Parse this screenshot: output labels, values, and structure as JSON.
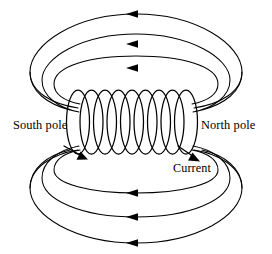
{
  "figure": {
    "type": "physics-diagram"
  },
  "labels": {
    "south_pole": "South pole",
    "north_pole": "North pole",
    "current": "Current"
  },
  "colors": {
    "stroke": "#000000",
    "background": "#ffffff"
  },
  "diagram": {
    "coil": {
      "turns": 9,
      "center_y": 122,
      "x_start": 78,
      "x_end": 186,
      "turn_rx": 11.5,
      "turn_ry": 32
    },
    "field_loops_top": [
      {
        "cx": 136,
        "cy": 52,
        "rx": 102,
        "ry": 44,
        "arrow_y": 14
      },
      {
        "cx": 136,
        "cy": 63,
        "rx": 88,
        "ry": 35,
        "arrow_y": 44
      },
      {
        "cx": 136,
        "cy": 75,
        "rx": 74,
        "ry": 26,
        "arrow_y": 68
      }
    ],
    "field_loops_bottom": [
      {
        "cx": 136,
        "cy": 196,
        "rx": 74,
        "ry": 26,
        "arrow_y": 193
      },
      {
        "cx": 136,
        "cy": 188,
        "rx": 88,
        "ry": 35,
        "arrow_y": 217
      },
      {
        "cx": 136,
        "cy": 200,
        "rx": 102,
        "ry": 44,
        "arrow_y": 243
      }
    ],
    "arrow_direction_field": "left",
    "current_arrows": [
      {
        "name": "current-arrow-left",
        "x": 84,
        "y": 155,
        "angle": 35
      },
      {
        "name": "current-arrow-right",
        "x": 196,
        "y": 157,
        "angle": 40
      }
    ]
  }
}
